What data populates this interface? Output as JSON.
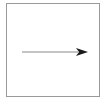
{
  "diagram": {
    "frame": {
      "border_color": "#9a9a9a"
    },
    "arrow": {
      "direction": "right",
      "line_color": "#8a8a8a",
      "head_color": "#1a1a1a",
      "start": [
        22,
        52
      ],
      "end": [
        88,
        52
      ]
    }
  }
}
